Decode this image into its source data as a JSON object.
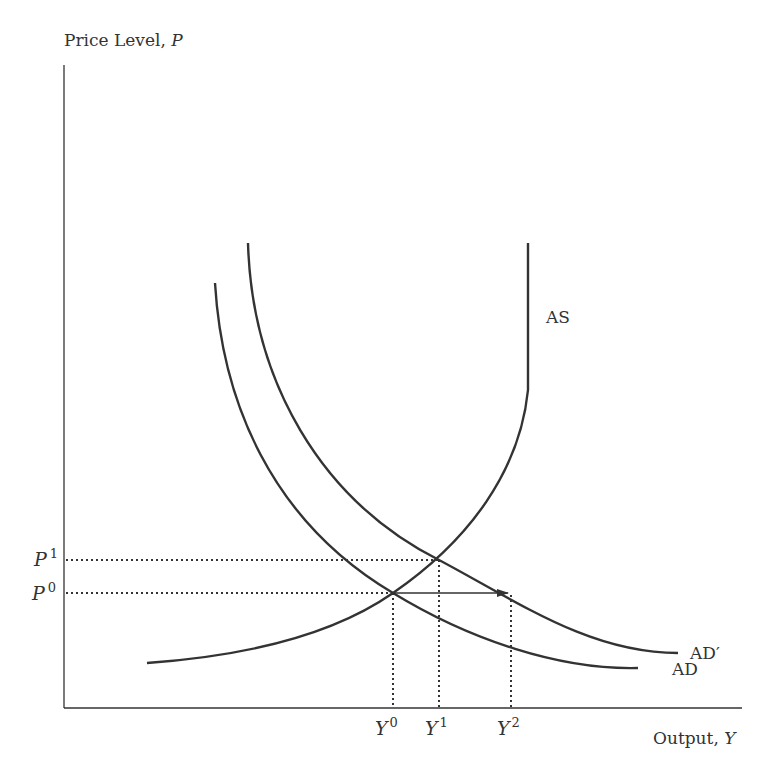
{
  "axes": {
    "y_title": "Price Level, ",
    "y_var": "P",
    "x_title": "Output, ",
    "x_var": "Y"
  },
  "curves": {
    "as_label": "AS",
    "ad_label": "AD",
    "ad_prime_label": "AD′"
  },
  "price_ticks": [
    {
      "base": "P",
      "sup": "1"
    },
    {
      "base": "P",
      "sup": "0"
    }
  ],
  "output_ticks": [
    {
      "base": "Y",
      "sup": "0"
    },
    {
      "base": "Y",
      "sup": "1"
    },
    {
      "base": "Y",
      "sup": "2"
    }
  ],
  "colors": {
    "line": "#333333",
    "background": "#ffffff"
  },
  "annotation": {
    "arrow": "horizontal shift from Y0 to Y2 at price level P0"
  }
}
